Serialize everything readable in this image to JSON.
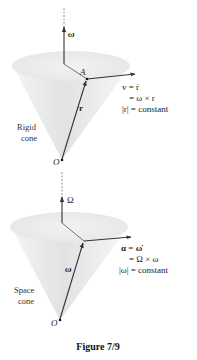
{
  "figure": {
    "caption": "Figure 7/9",
    "top_panel": {
      "cone_label_line1": "Rigid",
      "cone_label_line2": "cone",
      "axis_vector_label": "ω",
      "point_label": "A",
      "origin_label": "O",
      "position_vector_label": "r",
      "eq_line1": "v = ṙ",
      "eq_line2": "= ω × r",
      "eq_line3": "|r| = constant"
    },
    "bottom_panel": {
      "cone_label_line1": "Space",
      "cone_label_line2": "cone",
      "axis_vector_label": "Ω",
      "origin_label": "O",
      "angular_velocity_label": "ω",
      "eq_line1": "α = ω̇",
      "eq_line2": "= Ω × ω",
      "eq_line3": "|ω| = constant"
    },
    "colors": {
      "cone_fill": "#e9e9e9",
      "line": "#333333",
      "background": "#ffffff"
    }
  }
}
